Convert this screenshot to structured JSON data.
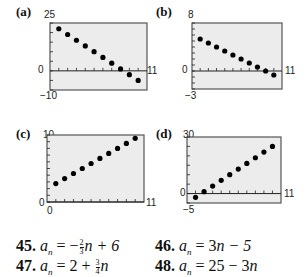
{
  "chart_data": [
    {
      "type": "scatter",
      "panel": "(a)",
      "x": [
        1,
        2,
        3,
        4,
        5,
        6,
        7,
        8,
        9,
        10
      ],
      "y": [
        22,
        19,
        16,
        13,
        10,
        7,
        4,
        1,
        -2,
        -5
      ],
      "xlim": [
        0,
        11
      ],
      "ylim": [
        -10,
        25
      ],
      "tick_labels": {
        "ymax": "25",
        "ymin": "-10",
        "origin": "0",
        "xmax": "11"
      },
      "grid": false
    },
    {
      "type": "scatter",
      "panel": "(b)",
      "x": [
        1,
        2,
        3,
        4,
        5,
        6,
        7,
        8,
        9,
        10
      ],
      "y": [
        5.33,
        4.67,
        4,
        3.33,
        2.67,
        2,
        1.33,
        0.67,
        0,
        -0.67
      ],
      "xlim": [
        0,
        11
      ],
      "ylim": [
        -3,
        8
      ],
      "tick_labels": {
        "ymax": "8",
        "ymin": "-3",
        "origin": "0",
        "xmax": "11"
      },
      "grid": false
    },
    {
      "type": "scatter",
      "panel": "(c)",
      "x": [
        1,
        2,
        3,
        4,
        5,
        6,
        7,
        8,
        9,
        10
      ],
      "y": [
        2.75,
        3.5,
        4.25,
        5,
        5.75,
        6.5,
        7.25,
        8,
        8.75,
        9.5
      ],
      "xlim": [
        0,
        11
      ],
      "ylim": [
        0,
        10
      ],
      "tick_labels": {
        "ymax": "10",
        "ymin": "0",
        "origin": "0",
        "xmax": "11"
      },
      "grid": false
    },
    {
      "type": "scatter",
      "panel": "(d)",
      "x": [
        1,
        2,
        3,
        4,
        5,
        6,
        7,
        8,
        9,
        10
      ],
      "y": [
        -2,
        1,
        4,
        7,
        10,
        13,
        16,
        19,
        22,
        25
      ],
      "xlim": [
        0,
        11
      ],
      "ylim": [
        -5,
        30
      ],
      "tick_labels": {
        "ymax": "30",
        "ymin": "-5",
        "origin": "0",
        "xmax": "11"
      },
      "grid": false
    }
  ],
  "panels": {
    "a": {
      "label": "(a)",
      "ymax": "25",
      "ymin": "−10",
      "origin": "0",
      "xmax": "11"
    },
    "b": {
      "label": "(b)",
      "ymax": "8",
      "ymin": "−3",
      "origin": "0",
      "xmax": "11"
    },
    "c": {
      "label": "(c)",
      "ymax": "10",
      "ymin": "0",
      "origin": "0",
      "xmax": "11"
    },
    "d": {
      "label": "(d)",
      "ymax": "30",
      "ymin": "−5",
      "origin": "0",
      "xmax": "11"
    }
  },
  "exercises": [
    {
      "number": "45.",
      "lhs": "a",
      "sub": "n",
      "eq": " = −",
      "frac_num": "2",
      "frac_den": "3",
      "rest": "n + 6"
    },
    {
      "number": "46.",
      "lhs": "a",
      "sub": "n",
      "eq": " = 3",
      "rest": "n − 5"
    },
    {
      "number": "47.",
      "lhs": "a",
      "sub": "n",
      "eq": " = 2 + ",
      "frac_num": "3",
      "frac_den": "4",
      "rest": "n"
    },
    {
      "number": "48.",
      "lhs": "a",
      "sub": "n",
      "eq": " = 25 − 3",
      "rest": "n"
    }
  ],
  "colors": {
    "plot_bg": "#ececec",
    "frame": "#555555",
    "point": "#000000"
  }
}
